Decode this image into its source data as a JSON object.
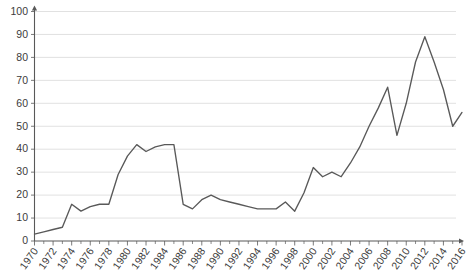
{
  "chart_data": {
    "type": "line",
    "title": "",
    "subtitle": "",
    "xlabel": "",
    "ylabel": "",
    "xlim": [
      1970,
      2016
    ],
    "ylim": [
      0,
      100
    ],
    "grid": true,
    "legend": null,
    "legend_position": "none",
    "y_ticks": [
      0,
      10,
      20,
      30,
      40,
      50,
      60,
      70,
      80,
      90,
      100
    ],
    "y_tick_labels": [
      "0",
      "10",
      "20",
      "30",
      "40",
      "50",
      "60",
      "70",
      "80",
      "90",
      "100"
    ],
    "x_tick_labels": [
      "1970",
      "1972",
      "1974",
      "1976",
      "1978",
      "1980",
      "1982",
      "1984",
      "1986",
      "1988",
      "1990",
      "1992",
      "1994",
      "1996",
      "1998",
      "2000",
      "2002",
      "2004",
      "2006",
      "2008",
      "2010",
      "2012",
      "2014",
      "2016"
    ],
    "x_tick_values": [
      1970,
      1972,
      1974,
      1976,
      1978,
      1980,
      1982,
      1984,
      1986,
      1988,
      1990,
      1992,
      1994,
      1996,
      1998,
      2000,
      2002,
      2004,
      2006,
      2008,
      2010,
      2012,
      2014,
      2016
    ],
    "x_minor_step": 1,
    "line_color": "#595959",
    "grid_color": "#d9d9d9",
    "axis_color": "#595959",
    "x": [
      1970,
      1971,
      1972,
      1973,
      1974,
      1975,
      1976,
      1977,
      1978,
      1979,
      1980,
      1981,
      1982,
      1983,
      1984,
      1985,
      1986,
      1987,
      1988,
      1989,
      1990,
      1991,
      1992,
      1993,
      1994,
      1995,
      1996,
      1997,
      1998,
      1999,
      2000,
      2001,
      2002,
      2003,
      2004,
      2005,
      2006,
      2007,
      2008,
      2009,
      2010,
      2011,
      2012,
      2013,
      2014,
      2015,
      2016
    ],
    "values": [
      3,
      4,
      5,
      6,
      16,
      13,
      15,
      16,
      16,
      29,
      37,
      42,
      39,
      41,
      42,
      42,
      16,
      14,
      18,
      20,
      18,
      17,
      16,
      15,
      14,
      14,
      14,
      17,
      13,
      21,
      32,
      28,
      30,
      28,
      34,
      41,
      50,
      58,
      67,
      46,
      60,
      78,
      89,
      78,
      66,
      50,
      56
    ],
    "series_name": ""
  }
}
